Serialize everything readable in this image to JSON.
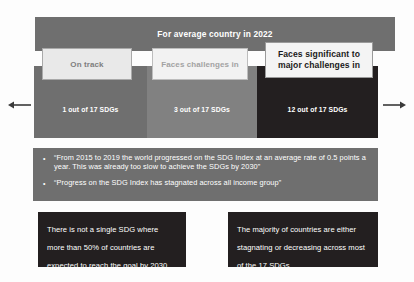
{
  "slide": {
    "header": {
      "title": "For average country in 2022"
    },
    "categories": [
      {
        "label": "On track",
        "value": "1 out of 17 SDGs",
        "band_color": "#6f6f6f",
        "label_box_color": "#e9e9e9",
        "label_text_color": "#7e7e7e"
      },
      {
        "label": "Faces challenges in",
        "value": "3 out of 17 SDGs",
        "band_color": "#818181",
        "label_box_color": "#f2f2f2",
        "label_text_color": "#a2a2a2"
      },
      {
        "label": "Faces significant to major challenges in",
        "value": "12 out of 17 SDGs",
        "band_color": "#231f20",
        "label_box_color": "#f4f4f4",
        "label_text_color": "#1b1b1b"
      }
    ],
    "arrows": {
      "left_icon": "arrow-left-icon",
      "right_icon": "arrow-right-icon"
    },
    "bullets": {
      "background_color": "#6f6f6f",
      "marker": "•",
      "items": [
        "“From 2015 to 2019 the world progressed on the SDG Index at an average rate of 0.5 points a year. This was already too slow to achieve the SDGs by 2030”",
        "“Progress on the SDG Index has stagnated across all income group”"
      ]
    },
    "callouts": [
      {
        "text": "There is not a single SDG where more than 50% of countries are expected to reach the goal by 2030",
        "background_color": "#231f20"
      },
      {
        "text": "The majority of countries are either stagnating or decreasing across most of the 17 SDGs",
        "background_color": "#231f20"
      }
    ]
  }
}
